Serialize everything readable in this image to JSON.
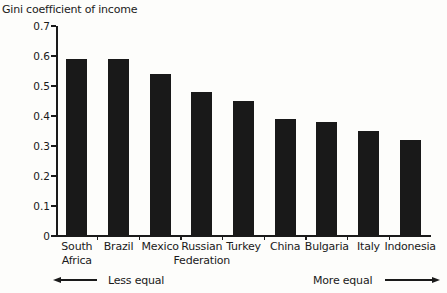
{
  "chart_data": {
    "type": "bar",
    "title": "Gini coefficient of income",
    "categories": [
      "South Africa",
      "Brazil",
      "Mexico",
      "Russian Federation",
      "Turkey",
      "China",
      "Bulgaria",
      "Italy",
      "Indonesia"
    ],
    "values": [
      0.59,
      0.59,
      0.54,
      0.48,
      0.45,
      0.39,
      0.38,
      0.35,
      0.32
    ],
    "xlabel": "",
    "ylabel": "",
    "ylim": [
      0,
      0.7
    ],
    "ytick_step": 0.1,
    "ytick_labels": [
      "0",
      "0.1",
      "0.2",
      "0.3",
      "0.4",
      "0.5",
      "0.6",
      "0.7"
    ],
    "grid": false,
    "legend": null,
    "bar_color": "#191919",
    "axis_color": "#1a1a1a",
    "annotations": {
      "left_arrow_label": "Less equal",
      "right_arrow_label": "More equal"
    }
  }
}
